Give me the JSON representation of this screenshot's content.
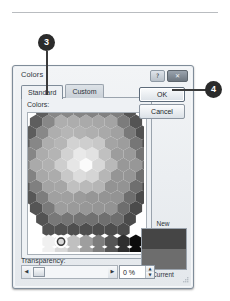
{
  "callouts": [
    {
      "id": "3",
      "label": "3"
    },
    {
      "id": "4",
      "label": "4"
    }
  ],
  "dialog": {
    "title": "Colors",
    "titlebar_buttons": [
      {
        "name": "help-button",
        "glyph": "?"
      },
      {
        "name": "close-button",
        "glyph": "✕"
      }
    ],
    "tabs": [
      {
        "label": "Standard",
        "active": true
      },
      {
        "label": "Custom",
        "active": false
      }
    ],
    "colors_label": "Colors:",
    "buttons": {
      "ok": "OK",
      "cancel": "Cancel"
    },
    "preview": {
      "new_label": "New",
      "current_label": "Current",
      "new_color": "#454545",
      "current_color": "#6d6d6d"
    },
    "transparency": {
      "label": "Transparency:",
      "value": "0 %",
      "slider_left_glyph": "◀",
      "slider_right_glyph": "▶",
      "spin_up_glyph": "▲",
      "spin_down_glyph": "▼",
      "slider_position_percent": 0
    },
    "palette": {
      "type": "honeycomb",
      "rings": 6,
      "selected_index": 0,
      "gray_row": [
        "#ffffff",
        "#f0f0f0",
        "#d9d9d9",
        "#c0c0c0",
        "#9e9e9e",
        "#7d7d7d",
        "#555555",
        "#2e2e2e",
        "#0d0d0d"
      ],
      "extra_swatch": "#1a1a1a",
      "ring_shades": [
        "#ededed",
        "#d5d5d5",
        "#b5b5b5",
        "#939393",
        "#6e6e6e",
        "#4b4b4b"
      ],
      "center_shade": "#fbfbfb"
    }
  }
}
